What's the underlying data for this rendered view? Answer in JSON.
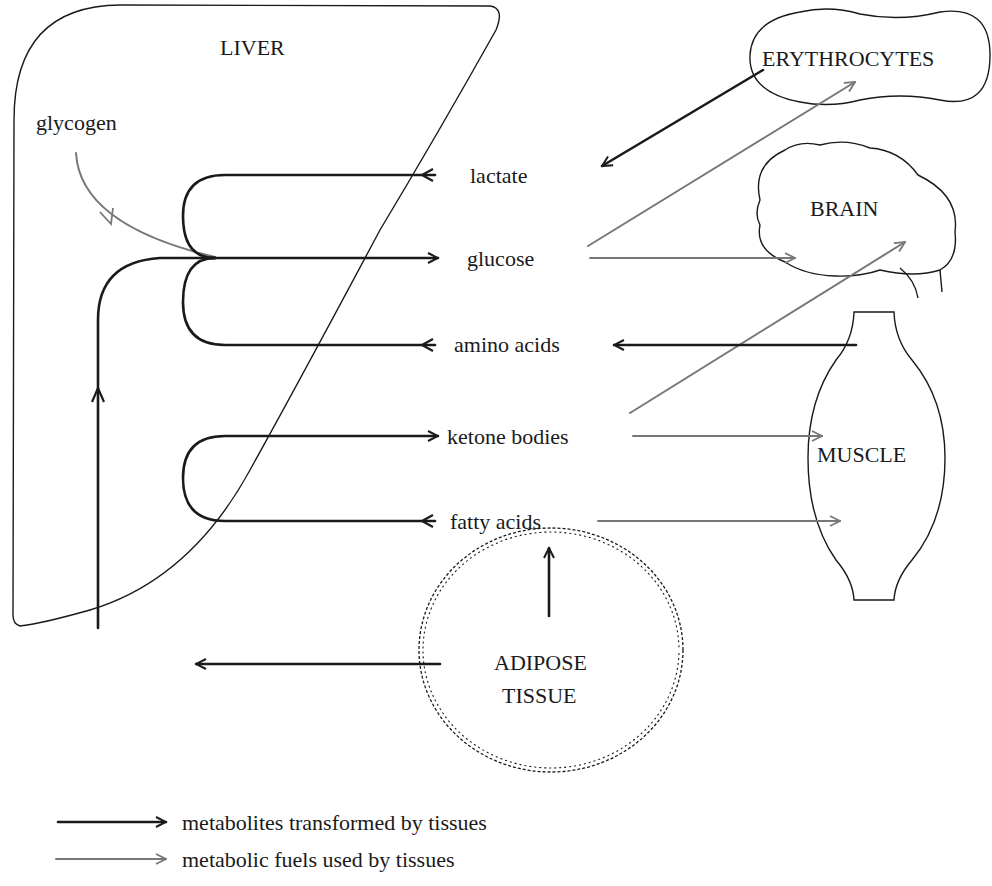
{
  "organs": {
    "liver": "LIVER",
    "erythrocytes": "ERYTHROCYTES",
    "brain": "BRAIN",
    "muscle": "MUSCLE",
    "adipose_line1": "ADIPOSE",
    "adipose_line2": "TISSUE"
  },
  "metabolites": {
    "glycogen": "glycogen",
    "lactate": "lactate",
    "glucose": "glucose",
    "amino_acids": "amino acids",
    "ketone_bodies": "ketone bodies",
    "fatty_acids": "fatty acids"
  },
  "legend": {
    "transformed": "metabolites transformed by tissues",
    "fuels": "metabolic fuels used by tissues"
  },
  "colors": {
    "transformed_arrow": "#1a1a1a",
    "fuel_arrow": "#777777",
    "background": "#ffffff"
  }
}
